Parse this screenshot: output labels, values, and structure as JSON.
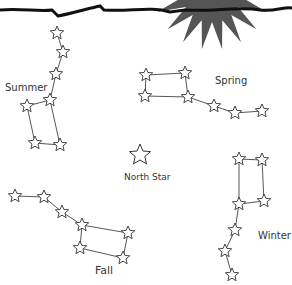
{
  "colors": {
    "sun": "#555555",
    "horizon": "#111111",
    "line": "#444444"
  },
  "labels": {
    "summer": "Summer",
    "spring": "Spring",
    "north_star": "North Star",
    "fall": "Fall",
    "winter": "Winter"
  },
  "constellations": [
    {
      "name": "Summer",
      "stars": [
        [
          57,
          33
        ],
        [
          63,
          52
        ],
        [
          56,
          74
        ],
        [
          50,
          100
        ],
        [
          27,
          106
        ],
        [
          35,
          143
        ],
        [
          60,
          145
        ]
      ],
      "lines": [
        [
          0,
          1
        ],
        [
          1,
          2
        ],
        [
          2,
          3
        ],
        [
          3,
          4
        ],
        [
          4,
          5
        ],
        [
          5,
          6
        ],
        [
          6,
          3
        ]
      ]
    },
    {
      "name": "Spring",
      "stars": [
        [
          146,
          75
        ],
        [
          185,
          73
        ],
        [
          145,
          96
        ],
        [
          188,
          97
        ],
        [
          214,
          106
        ],
        [
          235,
          113
        ],
        [
          262,
          111
        ]
      ],
      "lines": [
        [
          0,
          1
        ],
        [
          1,
          3
        ],
        [
          0,
          2
        ],
        [
          2,
          3
        ],
        [
          3,
          4
        ],
        [
          4,
          5
        ],
        [
          5,
          6
        ]
      ]
    },
    {
      "name": "Fall",
      "stars": [
        [
          15,
          196
        ],
        [
          44,
          197
        ],
        [
          62,
          212
        ],
        [
          82,
          225
        ],
        [
          128,
          233
        ],
        [
          80,
          248
        ],
        [
          123,
          258
        ]
      ],
      "lines": [
        [
          0,
          1
        ],
        [
          1,
          2
        ],
        [
          2,
          3
        ],
        [
          3,
          4
        ],
        [
          4,
          6
        ],
        [
          3,
          5
        ],
        [
          5,
          6
        ]
      ]
    },
    {
      "name": "Winter",
      "stars": [
        [
          239,
          159
        ],
        [
          262,
          160
        ],
        [
          239,
          204
        ],
        [
          264,
          201
        ],
        [
          235,
          230
        ],
        [
          225,
          251
        ],
        [
          232,
          275
        ]
      ],
      "lines": [
        [
          0,
          1
        ],
        [
          0,
          2
        ],
        [
          1,
          3
        ],
        [
          2,
          3
        ],
        [
          2,
          4
        ],
        [
          4,
          5
        ],
        [
          5,
          6
        ]
      ]
    }
  ],
  "north_star": [
    140,
    155
  ]
}
